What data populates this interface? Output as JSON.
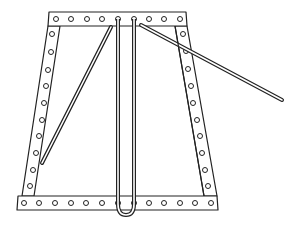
{
  "figure": {
    "title": "",
    "colors": {
      "stroke": "#222222",
      "background": "#ffffff",
      "fill": "#ffffff"
    },
    "parts": {
      "top_bar": {
        "holes": 9
      },
      "bottom_bar": {
        "holes": 13
      },
      "left_strut": {
        "holes": 10
      },
      "right_strut": {
        "holes": 10
      },
      "vertical_rods": 2,
      "u_loop": 1,
      "inner_diagonal_rod": 1,
      "long_rod": 1
    }
  }
}
